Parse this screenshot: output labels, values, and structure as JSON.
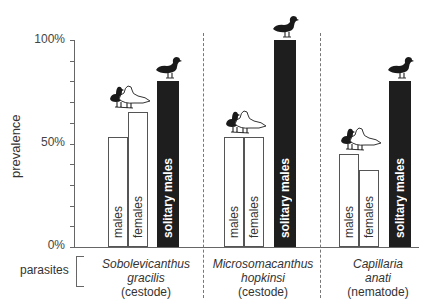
{
  "chart_data": {
    "type": "bar",
    "ylabel": "prevalence",
    "yticks": [
      "0%",
      "50%",
      "100%"
    ],
    "ylim": [
      0,
      100
    ],
    "group_axis_label": "parasites",
    "series_labels": [
      "males",
      "females",
      "solitary males"
    ],
    "groups": [
      {
        "name": "Sobolevicanthus gracilis",
        "line1": "Sobolevicanthus",
        "line2": "gracilis",
        "type": "(cestode)",
        "values": [
          53,
          65,
          80
        ]
      },
      {
        "name": "Microsomacanthus hopkinsi",
        "line1": "Microsomacanthus",
        "line2": "hopkinsi",
        "type": "(cestode)",
        "values": [
          53,
          53,
          100
        ]
      },
      {
        "name": "Capillaria anati",
        "line1": "Capillaria",
        "line2": "anati",
        "type": "(nematode)",
        "values": [
          45,
          37,
          80
        ]
      }
    ],
    "colors": {
      "paired": "#ffffff",
      "solitary": "#1e1e1e"
    }
  }
}
